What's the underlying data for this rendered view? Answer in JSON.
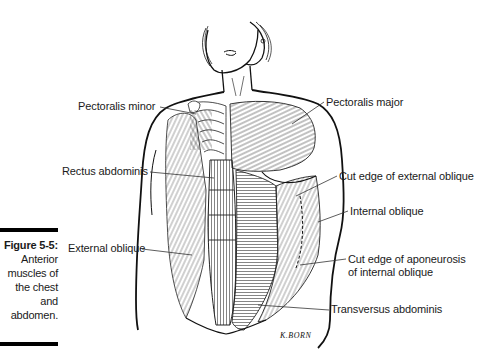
{
  "figure": {
    "number": "Figure 5-5:",
    "caption_lines": [
      "Anterior",
      "muscles of",
      "the chest",
      "and",
      "abdomen."
    ],
    "signature": "K.BORN"
  },
  "labels": [
    {
      "id": "pectoralis-minor",
      "text": "Pectoralis minor"
    },
    {
      "id": "pectoralis-major",
      "text": "Pectoralis major"
    },
    {
      "id": "rectus-abdominis",
      "text": "Rectus abdominis"
    },
    {
      "id": "cut-edge-external-oblique",
      "text": "Cut edge of external oblique"
    },
    {
      "id": "internal-oblique",
      "text": "Internal oblique"
    },
    {
      "id": "external-oblique",
      "text": "External oblique"
    },
    {
      "id": "cut-edge-aponeurosis",
      "text": "Cut edge of aponeurosis",
      "text2": "of internal oblique"
    },
    {
      "id": "transversus-abdominis",
      "text": "Transversus abdominis"
    }
  ]
}
